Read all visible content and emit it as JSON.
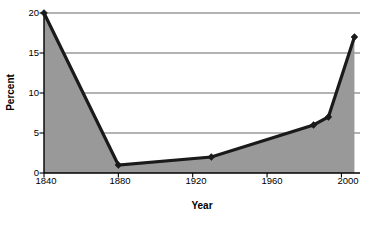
{
  "chart_data": {
    "type": "area",
    "title": "",
    "xlabel": "Year",
    "ylabel": "Percent",
    "x": [
      1840,
      1880,
      1930,
      1985,
      1993,
      2007
    ],
    "values": [
      20.0,
      1.0,
      2.0,
      6.0,
      7.0,
      17.0
    ],
    "series": [
      {
        "name": "Percent",
        "x": [
          1840,
          1880,
          1930,
          1985,
          1993,
          2007
        ],
        "values": [
          20.0,
          1.0,
          2.0,
          6.0,
          7.0,
          17.0
        ]
      }
    ],
    "xlim": [
      1840,
      2010
    ],
    "ylim": [
      0,
      20
    ],
    "xticks": [
      1840,
      1880,
      1920,
      1960,
      2000
    ],
    "xtick_labels": [
      "1840",
      "1880",
      "1920",
      "1960",
      "2000"
    ],
    "yticks": [
      0,
      5,
      10,
      15,
      20
    ],
    "ytick_labels": [
      "0",
      "5",
      "10",
      "15",
      "20"
    ],
    "grid": "horizontal",
    "legend": "none",
    "marker": "diamond",
    "fill_color": "#999999",
    "line_color": "#1a1a1a",
    "grid_color": "#555555",
    "axis_color": "#000000",
    "background_color": "#ffffff"
  },
  "axes": {
    "y_title": "Percent",
    "x_title": "Year",
    "y_tick_0": "0",
    "y_tick_1": "5",
    "y_tick_2": "10",
    "y_tick_3": "15",
    "y_tick_4": "20",
    "x_tick_0": "1840",
    "x_tick_1": "1880",
    "x_tick_2": "1920",
    "x_tick_3": "1960",
    "x_tick_4": "2000"
  }
}
